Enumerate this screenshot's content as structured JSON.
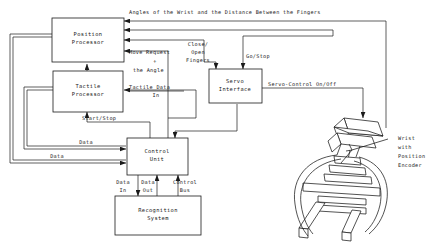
{
  "diagram": {
    "blocks": [
      {
        "id": "position_processor",
        "line1": "Position",
        "line2": "Processor"
      },
      {
        "id": "tactile_processor",
        "line1": "Tactile",
        "line2": "Processor"
      },
      {
        "id": "control_unit",
        "line1": "Control",
        "line2": "Unit"
      },
      {
        "id": "recognition_system",
        "line1": "Recognition",
        "line2": "System"
      },
      {
        "id": "servo_interface",
        "line1": "Servo",
        "line2": "Interface"
      }
    ],
    "edge_labels": {
      "angles_wrist": "Angles of the Wrist and the Distance Between the Fingers",
      "move_request_1": "Move Request",
      "move_request_2": "+",
      "move_request_3": "the Angle",
      "tactile_data_1": "Tactile Data",
      "tactile_data_2": "In",
      "start_stop": "Start/Stop",
      "data_upper": "Data",
      "data_lower": "Data",
      "close_open_1": "Close/",
      "close_open_2": "Open",
      "close_open_3": "Fingers",
      "go_stop": "Go/Stop",
      "servo_control": "Servo-Control On/Off",
      "data_in_1": "Data",
      "data_in_2": "In",
      "data_out_1": "Data",
      "data_out_2": "Out",
      "control_bus_1": "Control",
      "control_bus_2": "Bus"
    },
    "device": {
      "id": "wrist_with_position_encoder",
      "label_line1": "Wrist",
      "label_line2": "with",
      "label_line3": "Position",
      "label_line4": "Encoder"
    },
    "colors": {
      "stroke": "#1a1a1a",
      "background": "#ffffff"
    }
  }
}
